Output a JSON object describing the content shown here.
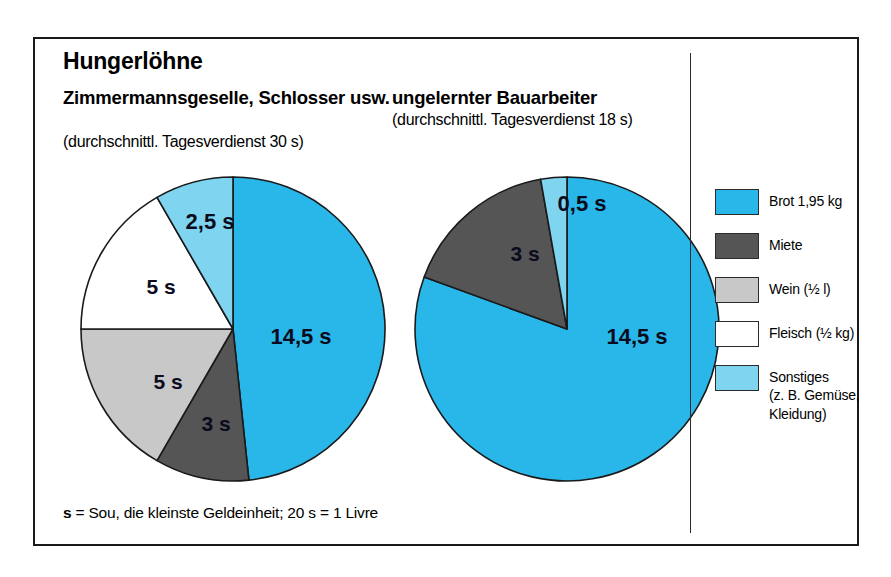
{
  "figure": {
    "title": "Hungerlöhne",
    "footnote_bold": "s",
    "footnote_rest": " = Sou, die kleinste Geldeinheit; 20 s = 1 Livre"
  },
  "columns": [
    {
      "heading": "Zimmermannsgeselle,\nSchlosser usw.",
      "subheading": "(durchschnittl. Tagesverdienst 30 s)"
    },
    {
      "heading": "ungelernter Bauarbeiter",
      "subheading": "(durchschnittl. Tagesverdienst 18 s)"
    }
  ],
  "legend": {
    "items": [
      {
        "label": "Brot  1,95 kg",
        "color": "#29b6e8",
        "name": "brot"
      },
      {
        "label": "Miete",
        "color": "#555555",
        "name": "miete"
      },
      {
        "label": "Wein (½ l)",
        "color": "#c8c8c8",
        "name": "wein"
      },
      {
        "label": "Fleisch (½ kg)",
        "color": "#ffffff",
        "name": "fleisch"
      },
      {
        "label": "Sonstiges\n(z. B. Gemüse,\nKleidung)",
        "color": "#7fd4f0",
        "name": "sonstiges"
      }
    ]
  },
  "colors": {
    "brot": "#29b6e8",
    "miete": "#555555",
    "wein": "#c8c8c8",
    "fleisch": "#ffffff",
    "sonstiges": "#7fd4f0",
    "outline": "#1a1a1a",
    "frame": "#1a1a1a",
    "label_text": "#0b0b1e"
  },
  "chart_data": {
    "type": "pie",
    "title": "Hungerlöhne",
    "unit": "s (Sou)",
    "note": "s = Sou, die kleinste Geldeinheit; 20 s = 1 Livre",
    "charts": [
      {
        "name": "Zimmermannsgeselle, Schlosser usw.",
        "subtitle": "(durchschnittl. Tagesverdienst 30 s)",
        "total_daily_wage": 30,
        "categories": [
          "Brot  1,95 kg",
          "Miete",
          "Wein (½ l)",
          "Fleisch (½ kg)",
          "Sonstiges (z. B. Gemüse, Kleidung)"
        ],
        "values": [
          14.5,
          3,
          5,
          5,
          2.5
        ],
        "labels": [
          "14,5 s",
          "3 s",
          "5 s",
          "5 s",
          "2,5 s"
        ],
        "colors": [
          "#29b6e8",
          "#555555",
          "#c8c8c8",
          "#ffffff",
          "#7fd4f0"
        ],
        "slices": [
          {
            "label": "14,5 s",
            "value": 14.5,
            "color": "#29b6e8",
            "start_deg": 0,
            "end_deg": 174,
            "label_x": 228,
            "label_y": 175
          },
          {
            "label": "3 s",
            "value": 3,
            "color": "#555555",
            "start_deg": 174,
            "end_deg": 210,
            "label_x": 143,
            "label_y": 262
          },
          {
            "label": "5 s",
            "value": 5,
            "color": "#c8c8c8",
            "start_deg": 210,
            "end_deg": 270,
            "label_x": 95,
            "label_y": 220
          },
          {
            "label": "5 s",
            "value": 5,
            "color": "#ffffff",
            "start_deg": 270,
            "end_deg": 330,
            "label_x": 88,
            "label_y": 125
          },
          {
            "label": "2,5 s",
            "value": 2.5,
            "color": "#7fd4f0",
            "start_deg": 330,
            "end_deg": 360,
            "label_x": 137,
            "label_y": 60
          }
        ]
      },
      {
        "name": "ungelernter Bauarbeiter",
        "subtitle": "(durchschnittl. Tagesverdienst 18 s)",
        "total_daily_wage": 18,
        "categories": [
          "Brot  1,95 kg",
          "Miete",
          "Sonstiges (z. B. Gemüse, Kleidung)"
        ],
        "values": [
          14.5,
          3,
          0.5
        ],
        "labels": [
          "14,5 s",
          "3 s",
          "0,5 s"
        ],
        "colors": [
          "#29b6e8",
          "#555555",
          "#7fd4f0"
        ],
        "slices": [
          {
            "label": "14,5 s",
            "value": 14.5,
            "color": "#29b6e8",
            "start_deg": 0,
            "end_deg": 290,
            "label_x": 230,
            "label_y": 175
          },
          {
            "label": "3 s",
            "value": 3,
            "color": "#555555",
            "start_deg": 290,
            "end_deg": 350,
            "label_x": 118,
            "label_y": 92
          },
          {
            "label": "0,5 s",
            "value": 0.5,
            "color": "#7fd4f0",
            "start_deg": 350,
            "end_deg": 360,
            "label_x": 175,
            "label_y": 42
          }
        ]
      }
    ]
  }
}
